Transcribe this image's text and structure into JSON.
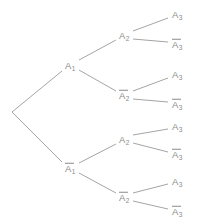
{
  "figure": {
    "type": "probability-tree-diagram",
    "width": 198,
    "height": 224,
    "background_color": "#ffffff",
    "line_color": "#9a9a9a",
    "text_color": "#8a8a8a"
  },
  "nodes": {
    "root": {
      "label": "",
      "x": 12,
      "y": 112,
      "negated": false
    },
    "a1": {
      "base": "A",
      "sub": "1",
      "x": 70,
      "y": 65,
      "negated": false
    },
    "a1bar": {
      "base": "A",
      "sub": "1",
      "x": 70,
      "y": 168,
      "negated": true
    },
    "a2_1": {
      "base": "A",
      "sub": "2",
      "x": 124,
      "y": 35,
      "negated": false
    },
    "a2_2": {
      "base": "A",
      "sub": "2",
      "x": 124,
      "y": 95,
      "negated": true
    },
    "a2_3": {
      "base": "A",
      "sub": "2",
      "x": 124,
      "y": 139,
      "negated": false
    },
    "a2_4": {
      "base": "A",
      "sub": "2",
      "x": 124,
      "y": 197,
      "negated": true
    },
    "a3_1": {
      "base": "A",
      "sub": "3",
      "x": 177,
      "y": 14,
      "negated": false
    },
    "a3_2": {
      "base": "A",
      "sub": "3",
      "x": 177,
      "y": 44,
      "negated": true
    },
    "a3_3": {
      "base": "A",
      "sub": "3",
      "x": 177,
      "y": 74,
      "negated": false
    },
    "a3_4": {
      "base": "A",
      "sub": "3",
      "x": 177,
      "y": 104,
      "negated": true
    },
    "a3_5": {
      "base": "A",
      "sub": "3",
      "x": 177,
      "y": 126,
      "negated": false
    },
    "a3_6": {
      "base": "A",
      "sub": "3",
      "x": 177,
      "y": 154,
      "negated": true
    },
    "a3_7": {
      "base": "A",
      "sub": "3",
      "x": 177,
      "y": 181,
      "negated": false
    },
    "a3_8": {
      "base": "A",
      "sub": "3",
      "x": 177,
      "y": 211,
      "negated": true
    }
  },
  "edges": [
    {
      "name": "root-to-a1",
      "x1": 12,
      "y1": 112,
      "x2": 62,
      "y2": 71
    },
    {
      "name": "root-to-a1bar",
      "x1": 12,
      "y1": 112,
      "x2": 62,
      "y2": 162
    },
    {
      "name": "a1-to-a2-1",
      "x1": 79,
      "y1": 60,
      "x2": 116,
      "y2": 40
    },
    {
      "name": "a1-to-a2-2",
      "x1": 79,
      "y1": 70,
      "x2": 116,
      "y2": 91
    },
    {
      "name": "a1bar-to-a2-3",
      "x1": 79,
      "y1": 163,
      "x2": 116,
      "y2": 144
    },
    {
      "name": "a1bar-to-a2-4",
      "x1": 79,
      "y1": 173,
      "x2": 116,
      "y2": 193
    },
    {
      "name": "a2-1-to-a3-1",
      "x1": 133,
      "y1": 31,
      "x2": 168,
      "y2": 18
    },
    {
      "name": "a2-1-to-a3-2",
      "x1": 133,
      "y1": 39,
      "x2": 168,
      "y2": 42
    },
    {
      "name": "a2-2-to-a3-3",
      "x1": 133,
      "y1": 91,
      "x2": 168,
      "y2": 78
    },
    {
      "name": "a2-2-to-a3-4",
      "x1": 133,
      "y1": 99,
      "x2": 168,
      "y2": 102
    },
    {
      "name": "a2-3-to-a3-5",
      "x1": 133,
      "y1": 135,
      "x2": 168,
      "y2": 129
    },
    {
      "name": "a2-3-to-a3-6",
      "x1": 133,
      "y1": 143,
      "x2": 168,
      "y2": 152
    },
    {
      "name": "a2-4-to-a3-7",
      "x1": 133,
      "y1": 193,
      "x2": 168,
      "y2": 184
    },
    {
      "name": "a2-4-to-a3-8",
      "x1": 133,
      "y1": 201,
      "x2": 168,
      "y2": 209
    }
  ]
}
